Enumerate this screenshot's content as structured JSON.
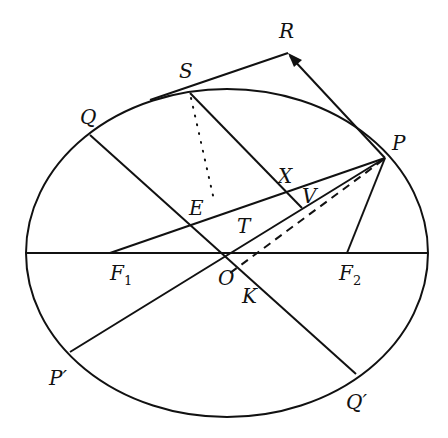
{
  "diagram": {
    "title": "",
    "ellipse": {
      "cx": 227,
      "cy": 253,
      "rx": 201,
      "ry": 164
    },
    "points": {
      "O": {
        "x": 227,
        "y": 253
      },
      "F1": {
        "x": 110,
        "y": 253
      },
      "F2": {
        "x": 347,
        "y": 253
      },
      "P": {
        "x": 385,
        "y": 158
      },
      "P_prime": {
        "x": 70,
        "y": 352
      },
      "Q": {
        "x": 90,
        "y": 135
      },
      "Q_prime": {
        "x": 356,
        "y": 374
      },
      "S": {
        "x": 190,
        "y": 93
      },
      "R": {
        "x": 288,
        "y": 53
      },
      "E": {
        "x": 190,
        "y": 223
      },
      "X": {
        "x": 283,
        "y": 191
      },
      "V": {
        "x": 302,
        "y": 208
      },
      "K": {
        "x": 241,
        "y": 265
      }
    },
    "labels": {
      "R": "R",
      "S": "S",
      "Q": "Q",
      "P": "P",
      "X": "X",
      "V": "V",
      "E": "E",
      "T": "T",
      "F1_main": "F",
      "F1_sub": "1",
      "F2_main": "F",
      "F2_sub": "2",
      "O": "O",
      "K": "K",
      "P_prime": "P′",
      "Q_prime": "Q′"
    },
    "line_style": {
      "color": "#111111"
    }
  }
}
